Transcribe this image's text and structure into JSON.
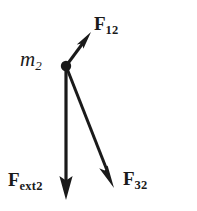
{
  "figure": {
    "kind": "free-body-diagram",
    "background_color": "#ffffff",
    "ink_color": "#1a1a1a",
    "width": 197,
    "height": 211
  },
  "body": {
    "mass_label_main": "m",
    "mass_label_sub": "2",
    "node_x": 66,
    "node_y": 66,
    "node_radius": 5.2
  },
  "vectors": [
    {
      "name": "F12",
      "label_main": "F",
      "label_sub": "12",
      "from_x": 66,
      "from_y": 66,
      "to_x": 91,
      "to_y": 32,
      "direction": "up-right",
      "label_x": 94,
      "label_y": 14
    },
    {
      "name": "F32",
      "label_main": "F",
      "label_sub": "32",
      "from_x": 66,
      "from_y": 66,
      "to_x": 114,
      "to_y": 188,
      "direction": "down-right",
      "label_x": 123,
      "label_y": 169
    },
    {
      "name": "Fext2",
      "label_main": "F",
      "label_sub": "ext2",
      "from_x": 66,
      "from_y": 66,
      "to_x": 66,
      "to_y": 200,
      "direction": "down",
      "label_x": 8,
      "label_y": 170
    }
  ]
}
